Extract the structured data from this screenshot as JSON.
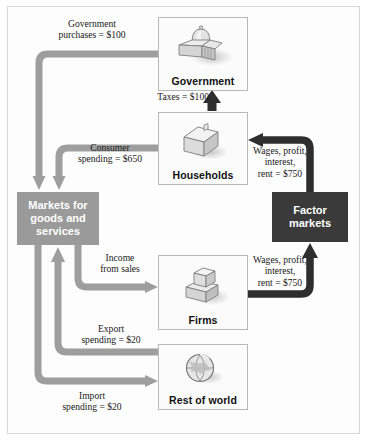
{
  "figure": {
    "colors": {
      "gray_flow": "#9e9e9e",
      "dark_flow": "#2e2e2e",
      "markets_block": "#9a9a9a",
      "factor_block": "#3a3a3a",
      "card_border": "#b9b9b9",
      "frame_border": "#d8d8d8",
      "background": "#ffffff",
      "label_text": "#1a1a1a",
      "reversed_text": "#ffffff"
    }
  },
  "entities": [
    {
      "id": "government",
      "label": "Government",
      "icon": "capitol-dome-icon"
    },
    {
      "id": "households",
      "label": "Households",
      "icon": "house-icon"
    },
    {
      "id": "firms",
      "label": "Firms",
      "icon": "factory-blocks-icon"
    },
    {
      "id": "restofworld",
      "label": "Rest of world",
      "icon": "globe-icon"
    }
  ],
  "markets": {
    "goods": {
      "id": "markets-goods-services",
      "label": "Markets for goods and services"
    },
    "factor": {
      "id": "factor-markets",
      "label": "Factor markets"
    }
  },
  "flows": [
    {
      "id": "government-purchases",
      "label": "Government\npurchases = $100",
      "line1": "Government",
      "line2": "purchases = $100",
      "amount": "$100",
      "from": "Government",
      "to": "Markets for goods and services",
      "style": "gray"
    },
    {
      "id": "taxes",
      "label": "Taxes = $100",
      "line1": "Taxes = $100",
      "line2": "",
      "amount": "$100",
      "from": "Households",
      "to": "Government",
      "style": "dark"
    },
    {
      "id": "consumer-spending",
      "label": "Consumer\nspending = $650",
      "line1": "Consumer",
      "line2": "spending = $650",
      "amount": "$650",
      "from": "Households",
      "to": "Markets for goods and services",
      "style": "gray"
    },
    {
      "id": "factor-payments-to-households",
      "label": "Wages, profit,\ninterest,\nrent = $750",
      "line1": "Wages, profit,",
      "line2": "interest,",
      "line3": "rent = $750",
      "amount": "$750",
      "from": "Factor markets",
      "to": "Households",
      "style": "dark"
    },
    {
      "id": "income-from-sales",
      "label": "Income\nfrom sales",
      "line1": "Income",
      "line2": "from sales",
      "amount": "",
      "from": "Markets for goods and services",
      "to": "Firms",
      "style": "gray"
    },
    {
      "id": "factor-payments-from-firms",
      "label": "Wages, profit,\ninterest,\nrent = $750",
      "line1": "Wages, profit,",
      "line2": "interest,",
      "line3": "rent = $750",
      "amount": "$750",
      "from": "Firms",
      "to": "Factor markets",
      "style": "dark"
    },
    {
      "id": "export-spending",
      "label": "Export\nspending = $20",
      "line1": "Export",
      "line2": "spending = $20",
      "amount": "$20",
      "from": "Rest of world",
      "to": "Markets for goods and services",
      "style": "gray"
    },
    {
      "id": "import-spending",
      "label": "Import\nspending = $20",
      "line1": "Import",
      "line2": "spending = $20",
      "amount": "$20",
      "from": "Markets for goods and services",
      "to": "Rest of world",
      "style": "gray"
    }
  ]
}
